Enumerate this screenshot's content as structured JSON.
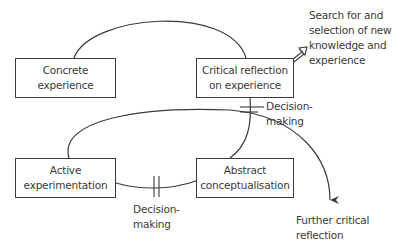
{
  "diagram": {
    "type": "learning-cycle",
    "nodes": [
      {
        "id": "concrete",
        "lines": [
          "Concrete",
          "experience"
        ]
      },
      {
        "id": "critical",
        "lines": [
          "Critical reflection",
          "on experience"
        ]
      },
      {
        "id": "active",
        "lines": [
          "Active",
          "experimentation"
        ]
      },
      {
        "id": "abstract",
        "lines": [
          "Abstract",
          "conceptualisation"
        ]
      }
    ],
    "annotations": {
      "search": [
        "Search for and",
        "selection of new",
        "knowledge and",
        "experience"
      ],
      "decision_right": [
        "Decision-",
        "making"
      ],
      "decision_bottom": [
        "Decision-",
        "making"
      ],
      "further": [
        "Further critical",
        "reflection"
      ]
    },
    "edges": [
      {
        "from": "concrete",
        "to": "critical",
        "style": "arc"
      },
      {
        "from": "critical",
        "to": "abstract",
        "style": "curve",
        "marker": "double-bar",
        "label": "decision_right"
      },
      {
        "from": "abstract",
        "to": "active",
        "style": "curve",
        "marker": "double-bar",
        "label": "decision_bottom"
      },
      {
        "from": "active",
        "to": "further",
        "style": "large-arc-arrow"
      },
      {
        "from": "critical",
        "to": "search",
        "style": "hollow-arrow"
      }
    ],
    "colors": {
      "stroke": "#3a3a3a",
      "background": "#ffffff"
    }
  }
}
